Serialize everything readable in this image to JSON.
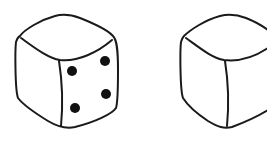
{
  "scene": {
    "description": "Two line-drawn dice",
    "dice": [
      {
        "name": "die-with-four-pips",
        "visible_face_pips": 4
      },
      {
        "name": "blank-die",
        "visible_face_pips": 0
      }
    ],
    "colors": {
      "stroke": "#1a1a1a",
      "pip": "#111111",
      "background": "#ffffff"
    }
  }
}
